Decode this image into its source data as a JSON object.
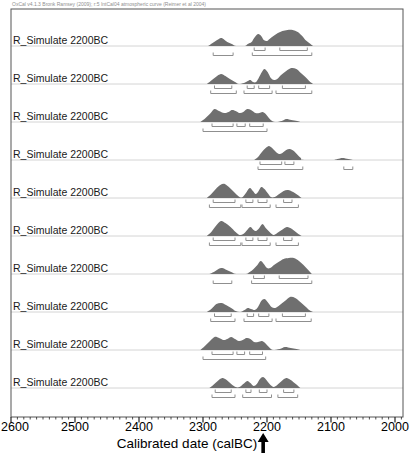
{
  "header": {
    "credit": "OxCal v4.1.3 Bronk Ramsey (2009); r:5 IntCal04 atmospheric curve (Reimer et al 2004)"
  },
  "axis": {
    "title": "Calibrated date (calBC)",
    "tick_labels": [
      "2600",
      "2500",
      "2400",
      "2300",
      "2200",
      "2100",
      "2000"
    ],
    "tick_years": [
      2600,
      2500,
      2400,
      2300,
      2200,
      2100,
      2000
    ],
    "minor_step_years": 10,
    "arrow_year": 2206
  },
  "colors": {
    "distribution_fill": "#6f6f6f",
    "bracket": "#8f8f8f",
    "baseline": "#d4d4d4",
    "frame": "#555555",
    "tick": "#222222",
    "arrow": "#000000"
  },
  "chart_data": {
    "type": "area",
    "xlabel": "Calibrated date (calBC)",
    "x_range": [
      2600,
      1987
    ],
    "legend": "each row: simulated calibrated radiocarbon date; upper brackets = 68.2% ranges, lower brackets = 95.4% ranges",
    "rows": [
      {
        "label": "R_Simulate 2200BC",
        "points": [
          [
            2292,
            0
          ],
          [
            2285,
            3
          ],
          [
            2278,
            6
          ],
          [
            2272,
            8
          ],
          [
            2268,
            7
          ],
          [
            2262,
            4
          ],
          [
            2255,
            2
          ],
          [
            2248,
            0
          ],
          [
            2235,
            0
          ],
          [
            2230,
            2
          ],
          [
            2224,
            4
          ],
          [
            2220,
            8
          ],
          [
            2214,
            12
          ],
          [
            2209,
            10
          ],
          [
            2205,
            6
          ],
          [
            2200,
            5
          ],
          [
            2196,
            7
          ],
          [
            2190,
            10
          ],
          [
            2183,
            13
          ],
          [
            2176,
            15
          ],
          [
            2168,
            16
          ],
          [
            2160,
            16
          ],
          [
            2152,
            14
          ],
          [
            2145,
            10
          ],
          [
            2140,
            6
          ],
          [
            2134,
            3
          ],
          [
            2128,
            0
          ]
        ],
        "ranges_68": [
          [
            2220,
            2203
          ],
          [
            2180,
            2137
          ]
        ],
        "ranges_95": [
          [
            2284,
            2253
          ],
          [
            2223,
            2130
          ]
        ]
      },
      {
        "label": "R_Simulate 2200BC",
        "points": [
          [
            2294,
            0
          ],
          [
            2288,
            3
          ],
          [
            2280,
            7
          ],
          [
            2272,
            10
          ],
          [
            2265,
            8
          ],
          [
            2258,
            5
          ],
          [
            2250,
            2
          ],
          [
            2244,
            0
          ],
          [
            2236,
            1
          ],
          [
            2230,
            3
          ],
          [
            2226,
            4
          ],
          [
            2222,
            2
          ],
          [
            2217,
            2
          ],
          [
            2213,
            6
          ],
          [
            2208,
            12
          ],
          [
            2204,
            15
          ],
          [
            2199,
            12
          ],
          [
            2194,
            6
          ],
          [
            2189,
            4
          ],
          [
            2184,
            5
          ],
          [
            2178,
            9
          ],
          [
            2170,
            13
          ],
          [
            2162,
            16
          ],
          [
            2154,
            15
          ],
          [
            2147,
            11
          ],
          [
            2140,
            7
          ],
          [
            2134,
            3
          ],
          [
            2128,
            0
          ]
        ],
        "ranges_68": [
          [
            2282,
            2255
          ],
          [
            2231,
            2220
          ],
          [
            2213,
            2196
          ],
          [
            2176,
            2140
          ]
        ],
        "ranges_95": [
          [
            2288,
            2248
          ],
          [
            2236,
            2192
          ],
          [
            2186,
            2130
          ]
        ]
      },
      {
        "label": "R_Simulate 2200BC",
        "points": [
          [
            2304,
            0
          ],
          [
            2296,
            4
          ],
          [
            2288,
            9
          ],
          [
            2282,
            13
          ],
          [
            2275,
            11
          ],
          [
            2267,
            9
          ],
          [
            2260,
            10
          ],
          [
            2255,
            12
          ],
          [
            2249,
            11
          ],
          [
            2243,
            9
          ],
          [
            2237,
            10
          ],
          [
            2231,
            13
          ],
          [
            2225,
            12
          ],
          [
            2218,
            9
          ],
          [
            2212,
            9
          ],
          [
            2207,
            10
          ],
          [
            2202,
            8
          ],
          [
            2197,
            4
          ],
          [
            2192,
            1
          ],
          [
            2186,
            0
          ],
          [
            2177,
            1
          ],
          [
            2170,
            3
          ],
          [
            2162,
            2
          ],
          [
            2153,
            1
          ],
          [
            2148,
            0
          ]
        ],
        "ranges_68": [
          [
            2286,
            2253
          ],
          [
            2247,
            2234
          ],
          [
            2227,
            2206
          ]
        ],
        "ranges_95": [
          [
            2300,
            2200
          ]
        ]
      },
      {
        "label": "R_Simulate 2200BC",
        "points": [
          [
            2220,
            0
          ],
          [
            2214,
            3
          ],
          [
            2208,
            8
          ],
          [
            2202,
            12
          ],
          [
            2197,
            14
          ],
          [
            2192,
            12
          ],
          [
            2186,
            8
          ],
          [
            2181,
            6
          ],
          [
            2176,
            7
          ],
          [
            2170,
            10
          ],
          [
            2164,
            11
          ],
          [
            2158,
            9
          ],
          [
            2152,
            5
          ],
          [
            2147,
            2
          ],
          [
            2142,
            0
          ],
          [
            2098,
            0
          ],
          [
            2090,
            1
          ],
          [
            2082,
            2
          ],
          [
            2073,
            1
          ],
          [
            2066,
            0
          ]
        ],
        "ranges_68": [
          [
            2211,
            2177
          ],
          [
            2172,
            2158
          ]
        ],
        "ranges_95": [
          [
            2214,
            2144
          ],
          [
            2080,
            2066
          ]
        ]
      },
      {
        "label": "R_Simulate 2200BC",
        "points": [
          [
            2294,
            0
          ],
          [
            2287,
            4
          ],
          [
            2280,
            9
          ],
          [
            2273,
            13
          ],
          [
            2266,
            14
          ],
          [
            2258,
            10
          ],
          [
            2250,
            5
          ],
          [
            2243,
            1
          ],
          [
            2238,
            1
          ],
          [
            2233,
            5
          ],
          [
            2227,
            10
          ],
          [
            2222,
            7
          ],
          [
            2218,
            4
          ],
          [
            2214,
            6
          ],
          [
            2209,
            11
          ],
          [
            2204,
            9
          ],
          [
            2199,
            5
          ],
          [
            2194,
            1
          ],
          [
            2188,
            1
          ],
          [
            2181,
            4
          ],
          [
            2174,
            7
          ],
          [
            2167,
            8
          ],
          [
            2159,
            6
          ],
          [
            2152,
            3
          ],
          [
            2146,
            0
          ]
        ],
        "ranges_68": [
          [
            2284,
            2250
          ],
          [
            2233,
            2222
          ],
          [
            2214,
            2200
          ],
          [
            2174,
            2161
          ]
        ],
        "ranges_95": [
          [
            2290,
            2241
          ],
          [
            2239,
            2195
          ],
          [
            2186,
            2151
          ]
        ]
      },
      {
        "label": "R_Simulate 2200BC",
        "points": [
          [
            2294,
            0
          ],
          [
            2287,
            4
          ],
          [
            2280,
            10
          ],
          [
            2272,
            15
          ],
          [
            2265,
            13
          ],
          [
            2257,
            9
          ],
          [
            2249,
            4
          ],
          [
            2243,
            1
          ],
          [
            2237,
            2
          ],
          [
            2231,
            6
          ],
          [
            2226,
            9
          ],
          [
            2221,
            6
          ],
          [
            2217,
            5
          ],
          [
            2212,
            8
          ],
          [
            2207,
            12
          ],
          [
            2202,
            8
          ],
          [
            2196,
            4
          ],
          [
            2190,
            1
          ],
          [
            2184,
            3
          ],
          [
            2177,
            6
          ],
          [
            2169,
            9
          ],
          [
            2161,
            7
          ],
          [
            2153,
            3
          ],
          [
            2146,
            0
          ]
        ],
        "ranges_68": [
          [
            2284,
            2250
          ],
          [
            2233,
            2222
          ],
          [
            2214,
            2200
          ],
          [
            2174,
            2161
          ]
        ],
        "ranges_95": [
          [
            2290,
            2241
          ],
          [
            2239,
            2195
          ],
          [
            2186,
            2151
          ]
        ]
      },
      {
        "label": "R_Simulate 2200BC",
        "points": [
          [
            2290,
            0
          ],
          [
            2283,
            2
          ],
          [
            2276,
            5
          ],
          [
            2270,
            6
          ],
          [
            2263,
            4
          ],
          [
            2256,
            2
          ],
          [
            2248,
            0
          ],
          [
            2233,
            0
          ],
          [
            2227,
            2
          ],
          [
            2221,
            5
          ],
          [
            2215,
            9
          ],
          [
            2210,
            13
          ],
          [
            2205,
            10
          ],
          [
            2200,
            6
          ],
          [
            2195,
            6
          ],
          [
            2189,
            9
          ],
          [
            2182,
            12
          ],
          [
            2174,
            15
          ],
          [
            2166,
            16
          ],
          [
            2158,
            16
          ],
          [
            2150,
            13
          ],
          [
            2143,
            9
          ],
          [
            2137,
            5
          ],
          [
            2130,
            0
          ]
        ],
        "ranges_68": [
          [
            2221,
            2204
          ],
          [
            2181,
            2136
          ]
        ],
        "ranges_95": [
          [
            2284,
            2255
          ],
          [
            2224,
            2130
          ]
        ]
      },
      {
        "label": "R_Simulate 2200BC",
        "points": [
          [
            2294,
            0
          ],
          [
            2287,
            3
          ],
          [
            2279,
            8
          ],
          [
            2271,
            9
          ],
          [
            2264,
            7
          ],
          [
            2256,
            4
          ],
          [
            2249,
            1
          ],
          [
            2242,
            0
          ],
          [
            2235,
            2
          ],
          [
            2230,
            4
          ],
          [
            2225,
            3
          ],
          [
            2219,
            2
          ],
          [
            2214,
            5
          ],
          [
            2209,
            11
          ],
          [
            2204,
            13
          ],
          [
            2199,
            10
          ],
          [
            2193,
            5
          ],
          [
            2187,
            4
          ],
          [
            2180,
            7
          ],
          [
            2172,
            11
          ],
          [
            2164,
            15
          ],
          [
            2156,
            14
          ],
          [
            2148,
            10
          ],
          [
            2141,
            6
          ],
          [
            2134,
            2
          ],
          [
            2128,
            0
          ]
        ],
        "ranges_68": [
          [
            2282,
            2256
          ],
          [
            2231,
            2221
          ],
          [
            2213,
            2197
          ],
          [
            2176,
            2140
          ]
        ],
        "ranges_95": [
          [
            2288,
            2250
          ],
          [
            2236,
            2192
          ],
          [
            2186,
            2131
          ]
        ]
      },
      {
        "label": "R_Simulate 2200BC",
        "points": [
          [
            2304,
            0
          ],
          [
            2297,
            4
          ],
          [
            2289,
            9
          ],
          [
            2282,
            13
          ],
          [
            2275,
            12
          ],
          [
            2268,
            10
          ],
          [
            2262,
            11
          ],
          [
            2256,
            13
          ],
          [
            2250,
            11
          ],
          [
            2244,
            9
          ],
          [
            2238,
            10
          ],
          [
            2232,
            12
          ],
          [
            2226,
            11
          ],
          [
            2220,
            8
          ],
          [
            2214,
            8
          ],
          [
            2208,
            9
          ],
          [
            2203,
            7
          ],
          [
            2197,
            3
          ],
          [
            2191,
            0
          ],
          [
            2180,
            1
          ],
          [
            2172,
            3
          ],
          [
            2163,
            2
          ],
          [
            2154,
            1
          ],
          [
            2148,
            0
          ]
        ],
        "ranges_68": [
          [
            2286,
            2253
          ],
          [
            2247,
            2235
          ],
          [
            2227,
            2207
          ]
        ],
        "ranges_95": [
          [
            2300,
            2202
          ]
        ]
      },
      {
        "label": "R_Simulate 2200BC",
        "points": [
          [
            2290,
            0
          ],
          [
            2284,
            3
          ],
          [
            2277,
            7
          ],
          [
            2270,
            10
          ],
          [
            2263,
            8
          ],
          [
            2256,
            4
          ],
          [
            2249,
            1
          ],
          [
            2243,
            1
          ],
          [
            2237,
            4
          ],
          [
            2231,
            7
          ],
          [
            2226,
            5
          ],
          [
            2221,
            2
          ],
          [
            2216,
            4
          ],
          [
            2211,
            9
          ],
          [
            2206,
            11
          ],
          [
            2201,
            8
          ],
          [
            2196,
            4
          ],
          [
            2190,
            1
          ],
          [
            2184,
            3
          ],
          [
            2177,
            7
          ],
          [
            2170,
            10
          ],
          [
            2163,
            8
          ],
          [
            2155,
            4
          ],
          [
            2148,
            0
          ]
        ],
        "ranges_68": [
          [
            2281,
            2256
          ],
          [
            2233,
            2225
          ],
          [
            2212,
            2200
          ],
          [
            2174,
            2158
          ]
        ],
        "ranges_95": [
          [
            2286,
            2250
          ],
          [
            2238,
            2193
          ],
          [
            2183,
            2152
          ]
        ]
      }
    ]
  }
}
